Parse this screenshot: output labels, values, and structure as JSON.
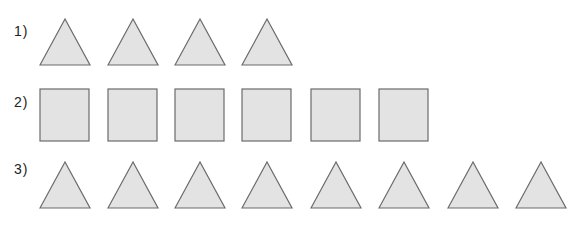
{
  "rows": [
    {
      "label": "1)",
      "shape": "triangle",
      "count": 4
    },
    {
      "label": "2)",
      "shape": "square",
      "count": 6
    },
    {
      "label": "3)",
      "shape": "triangle",
      "count": 8
    }
  ],
  "colors": {
    "fill": "#e3e3e3",
    "stroke": "#6b6b6b",
    "text": "#222222"
  }
}
